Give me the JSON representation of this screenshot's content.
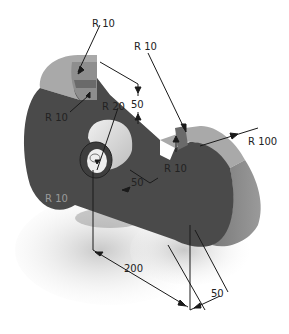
{
  "drawing": {
    "title": "Isometric part with dimensions",
    "colors": {
      "body_dark": "#4a4a4a",
      "top_face": "#a9a9a9",
      "side_face": "#8c8c8c",
      "boss": "#d8d8d8",
      "dim_line": "#1a1a1a",
      "reflection": "#d4d4d4",
      "ghost_text": "#9a9a9a"
    },
    "dimensions": [
      {
        "id": "r10-top-left",
        "label": "R 10"
      },
      {
        "id": "r10-top-mid",
        "label": "R 10"
      },
      {
        "id": "r10-left",
        "label": "R 10"
      },
      {
        "id": "r20-hole",
        "label": "R 20"
      },
      {
        "id": "slot-width",
        "label": "50"
      },
      {
        "id": "r10-slot-right",
        "label": "R 10"
      },
      {
        "id": "r100-outer",
        "label": "R 100"
      },
      {
        "id": "boss-length",
        "label": "50"
      },
      {
        "id": "overall-length",
        "label": "200"
      },
      {
        "id": "thickness",
        "label": "50"
      },
      {
        "id": "r10-reflection",
        "label": "R 10"
      }
    ]
  }
}
